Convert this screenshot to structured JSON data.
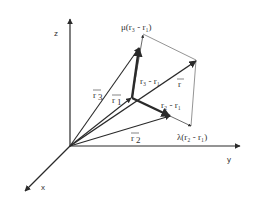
{
  "diagram": {
    "colors": {
      "line": "#2a2a2a",
      "thin": "#555555",
      "text": "#333333",
      "background": "#ffffff"
    },
    "axes": {
      "z": {
        "label": "z"
      },
      "y": {
        "label": "y"
      },
      "x": {
        "label": "x"
      }
    },
    "labels": {
      "r1": "r",
      "r1_sub": "1",
      "r2": "r",
      "r2_sub": "2",
      "r3": "r",
      "r3_sub": "3",
      "r": "r",
      "r3_minus_r1": "r₃ - r₁",
      "r2_minus_r1": "r₂ - r₁",
      "mu_term": "μ(r₃ - r₁)",
      "lambda_term": "λ(r₂ - r₁)"
    }
  }
}
